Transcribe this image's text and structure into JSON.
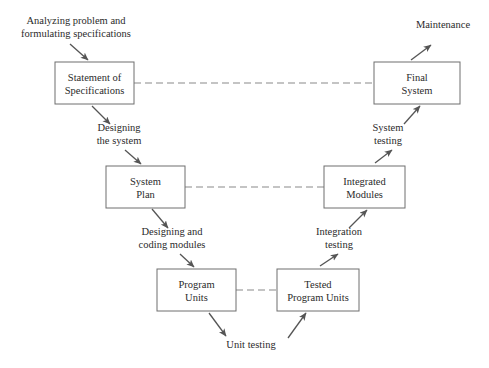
{
  "diagram": {
    "colors": {
      "box_stroke": "#6e6e6e",
      "arrow": "#555555",
      "dashed": "#8a8a8a",
      "text": "#2b2b2b",
      "background": "#ffffff"
    },
    "boxes": [
      {
        "id": "statement",
        "label_line1": "Statement of",
        "label_line2": "Specifications",
        "x": 55,
        "y": 62,
        "w": 79,
        "h": 42
      },
      {
        "id": "final_system",
        "label_line1": "Final",
        "label_line2": "System",
        "x": 374,
        "y": 62,
        "w": 86,
        "h": 42
      },
      {
        "id": "system_plan",
        "label_line1": "System",
        "label_line2": "Plan",
        "x": 106,
        "y": 166,
        "w": 79,
        "h": 42
      },
      {
        "id": "integrated_modules",
        "label_line1": "Integrated",
        "label_line2": "Modules",
        "x": 324,
        "y": 166,
        "w": 81,
        "h": 42
      },
      {
        "id": "program_units",
        "label_line1": "Program",
        "label_line2": "Units",
        "x": 157,
        "y": 269,
        "w": 79,
        "h": 42
      },
      {
        "id": "tested_program_units",
        "label_line1": "Tested",
        "label_line2": "Program Units",
        "x": 277,
        "y": 269,
        "w": 82,
        "h": 42
      }
    ],
    "annotations": [
      {
        "id": "analyzing",
        "line1": "Analyzing problem and",
        "line2": "formulating specifications",
        "cx": 76,
        "y1": 24,
        "y2": 37
      },
      {
        "id": "maintenance",
        "line1": "Maintenance",
        "line2": "",
        "cx": 443,
        "y1": 28,
        "y2": 41
      },
      {
        "id": "designing_system",
        "line1": "Designing",
        "line2": "the system",
        "cx": 119,
        "y1": 131,
        "y2": 144
      },
      {
        "id": "system_testing",
        "line1": "System",
        "line2": "testing",
        "cx": 388,
        "y1": 131,
        "y2": 144
      },
      {
        "id": "designing_coding",
        "line1": "Designing and",
        "line2": "coding modules",
        "cx": 172,
        "y1": 235,
        "y2": 248
      },
      {
        "id": "integration_testing",
        "line1": "Integration",
        "line2": "testing",
        "cx": 339,
        "y1": 235,
        "y2": 248
      },
      {
        "id": "unit_testing",
        "line1": "Unit testing",
        "line2": "",
        "cx": 251,
        "y1": 348,
        "y2": 361
      }
    ],
    "dashed_links": [
      {
        "id": "statement-to-final",
        "x1": 134,
        "y1": 83,
        "x2": 374,
        "y2": 83
      },
      {
        "id": "plan-to-integrated",
        "x1": 185,
        "y1": 187,
        "x2": 324,
        "y2": 187
      },
      {
        "id": "units-to-tested",
        "x1": 236,
        "y1": 290,
        "x2": 277,
        "y2": 290
      }
    ],
    "arrows": [
      {
        "id": "analyzing-to-statement",
        "x1": 70,
        "y1": 44,
        "x2": 88,
        "y2": 60
      },
      {
        "id": "statement-to-designing",
        "x1": 92,
        "y1": 106,
        "x2": 110,
        "y2": 124
      },
      {
        "id": "designing-to-plan",
        "x1": 125,
        "y1": 150,
        "x2": 141,
        "y2": 164
      },
      {
        "id": "plan-to-coding",
        "x1": 152,
        "y1": 209,
        "x2": 168,
        "y2": 228
      },
      {
        "id": "coding-to-units",
        "x1": 180,
        "y1": 254,
        "x2": 194,
        "y2": 267
      },
      {
        "id": "units-to-unittest",
        "x1": 209,
        "y1": 313,
        "x2": 226,
        "y2": 336
      },
      {
        "id": "unittest-to-tested",
        "x1": 288,
        "y1": 338,
        "x2": 306,
        "y2": 313
      },
      {
        "id": "tested-to-integration",
        "x1": 320,
        "y1": 266,
        "x2": 338,
        "y2": 254
      },
      {
        "id": "integration-to-integrated",
        "x1": 349,
        "y1": 228,
        "x2": 367,
        "y2": 210
      },
      {
        "id": "integrated-to-systemtest",
        "x1": 375,
        "y1": 163,
        "x2": 392,
        "y2": 150
      },
      {
        "id": "systemtest-to-final",
        "x1": 404,
        "y1": 124,
        "x2": 420,
        "y2": 106
      },
      {
        "id": "final-to-maintenance",
        "x1": 411,
        "y1": 60,
        "x2": 431,
        "y2": 45
      }
    ]
  }
}
